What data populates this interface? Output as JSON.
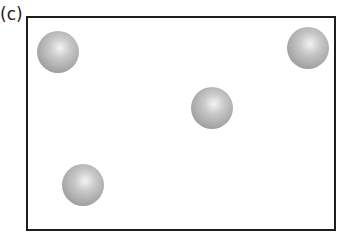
{
  "figure": {
    "panel_label": "(c)",
    "box": {
      "x": 27,
      "y": 17,
      "width": 308,
      "height": 213
    },
    "spheres": [
      {
        "id": "sphere-1",
        "cx": 58,
        "cy": 52,
        "r": 21
      },
      {
        "id": "sphere-2",
        "cx": 308,
        "cy": 48,
        "r": 21
      },
      {
        "id": "sphere-3",
        "cx": 212,
        "cy": 108,
        "r": 21
      },
      {
        "id": "sphere-4",
        "cx": 83,
        "cy": 185,
        "r": 21
      }
    ],
    "colors": {
      "border": "#1e1e1e",
      "sphere_light": "#f4f4f4",
      "sphere_dark": "#8d8d8d"
    }
  }
}
